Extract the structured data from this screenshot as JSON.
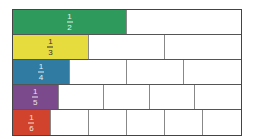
{
  "rows": [
    {
      "numerator": "1",
      "denominator": "2",
      "parts": 2,
      "color": "#2e9a5c",
      "text_color": "#e8f3ea"
    },
    {
      "numerator": "1",
      "denominator": "3",
      "parts": 3,
      "color": "#e6dc3e",
      "text_color": "#333333"
    },
    {
      "numerator": "1",
      "denominator": "4",
      "parts": 4,
      "color": "#2f7ba2",
      "text_color": "#e6eef4"
    },
    {
      "numerator": "1",
      "denominator": "5",
      "parts": 5,
      "color": "#7a4a8c",
      "text_color": "#ece4ef"
    },
    {
      "numerator": "1",
      "denominator": "6",
      "parts": 6,
      "color": "#d2432e",
      "text_color": "#f6e3de"
    }
  ]
}
